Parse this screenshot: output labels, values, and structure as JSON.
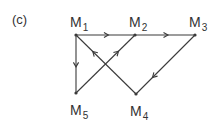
{
  "figure_label": "(c)",
  "colors": {
    "line": "#3a3a3a",
    "text": "#333333",
    "background": "#ffffff"
  },
  "nodes": [
    {
      "id": "M1",
      "base": "M",
      "sub": "1",
      "x": 76,
      "y": 35
    },
    {
      "id": "M2",
      "base": "M",
      "sub": "2",
      "x": 135,
      "y": 35
    },
    {
      "id": "M3",
      "base": "M",
      "sub": "3",
      "x": 195,
      "y": 35
    },
    {
      "id": "M4",
      "base": "M",
      "sub": "4",
      "x": 136,
      "y": 94
    },
    {
      "id": "M5",
      "base": "M",
      "sub": "5",
      "x": 76,
      "y": 93
    }
  ],
  "edges": [
    {
      "from": "M1",
      "to": "M2"
    },
    {
      "from": "M2",
      "to": "M3"
    },
    {
      "from": "M1",
      "to": "M5"
    },
    {
      "from": "M3",
      "to": "M4"
    },
    {
      "from": "M4",
      "to": "M1"
    },
    {
      "from": "M5",
      "to": "M2"
    }
  ]
}
